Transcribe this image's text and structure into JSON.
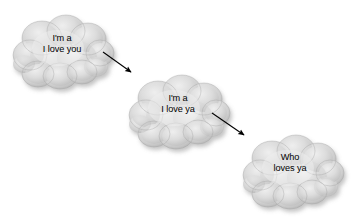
{
  "diagram": {
    "background_color": "#ffffff",
    "cloud_fill_color": "#d6d6d6",
    "cloud_highlight_color": "#efefef",
    "cloud_shadow_color": "#a5a5a5",
    "cloud_outline_color": "#9a9a9a",
    "arrow_color": "#000000",
    "text_color": "#000000",
    "clouds": [
      {
        "id": "cloud-1",
        "line1": "I'm a",
        "line2": "I love you",
        "x": 12,
        "y": 12,
        "width": 100,
        "height": 80,
        "label_left": 26,
        "label_top": 33
      },
      {
        "id": "cloud-2",
        "line1": "I'm a",
        "line2": "I love ya",
        "x": 128,
        "y": 72,
        "width": 100,
        "height": 80,
        "label_left": 142,
        "label_top": 93
      },
      {
        "id": "cloud-3",
        "line1": "Who",
        "line2": "loves ya",
        "x": 240,
        "y": 132,
        "width": 104,
        "height": 80,
        "label_left": 252,
        "label_top": 151
      }
    ],
    "arrows": [
      {
        "id": "arrow-1",
        "from_cloud": "cloud-1",
        "to_cloud": "cloud-2",
        "x1": 103,
        "y1": 52,
        "x2": 133,
        "y2": 73
      },
      {
        "id": "arrow-2",
        "from_cloud": "cloud-2",
        "to_cloud": "cloud-3",
        "x1": 212,
        "y1": 113,
        "x2": 246,
        "y2": 136
      }
    ]
  }
}
